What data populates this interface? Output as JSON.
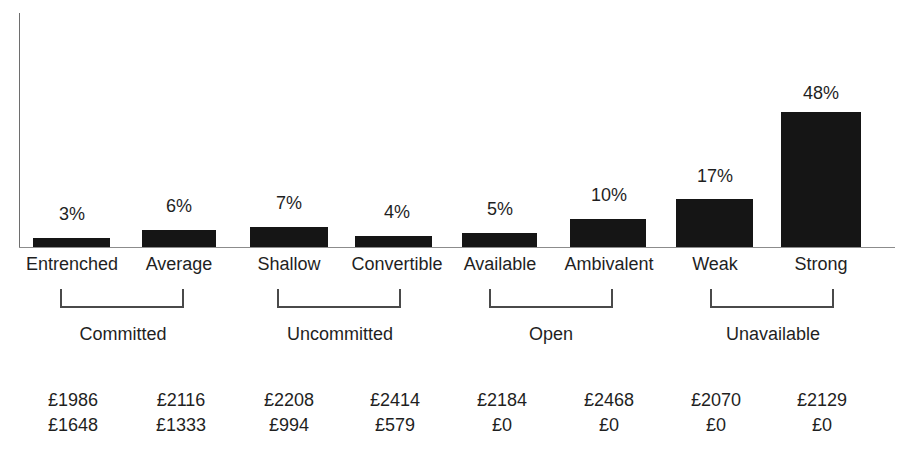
{
  "chart_data": {
    "type": "bar",
    "title": "",
    "subtitle": "",
    "xlabel": "",
    "ylabel": "",
    "ylim": [
      0,
      48
    ],
    "grid": false,
    "legend": "none",
    "axis": {
      "x_axis_visible": true,
      "y_axis_visible": true,
      "y_ticks": []
    },
    "categories": [
      "Entrenched",
      "Average",
      "Shallow",
      "Convertible",
      "Available",
      "Ambivalent",
      "Weak",
      "Strong"
    ],
    "values": [
      3,
      6,
      7,
      4,
      5,
      10,
      17,
      48
    ],
    "value_labels": [
      "3%",
      "6%",
      "7%",
      "4%",
      "5%",
      "10%",
      "17%",
      "48%"
    ],
    "groups": [
      {
        "label": "Committed",
        "categories": [
          "Entrenched",
          "Average"
        ]
      },
      {
        "label": "Uncommitted",
        "categories": [
          "Shallow",
          "Convertible"
        ]
      },
      {
        "label": "Open",
        "categories": [
          "Available",
          "Ambivalent"
        ]
      },
      {
        "label": "Unavailable",
        "categories": [
          "Weak",
          "Strong"
        ]
      }
    ],
    "annotations": {
      "row1": [
        "£1986",
        "£2116",
        "£2208",
        "£2414",
        "£2184",
        "£2468",
        "£2070",
        "£2129"
      ],
      "row2": [
        "£1648",
        "£1333",
        "£994",
        "£579",
        "£0",
        "£0",
        "£0",
        "£0"
      ]
    },
    "colors": {
      "bar": "#151515",
      "axis": "#8c8c8c",
      "text": "#1f1f1f",
      "bracket": "#4a4a4a",
      "background": "#ffffff"
    }
  },
  "bars": [
    {
      "label": "Entrenched",
      "value_label": "3%",
      "left": 33,
      "width": 77,
      "height": 9,
      "label_left": 10,
      "label_width": 124,
      "value_left": 10,
      "value_width": 124,
      "value_top": 205
    },
    {
      "label": "Average",
      "value_label": "6%",
      "left": 142,
      "width": 74,
      "height": 17,
      "label_left": 120,
      "label_width": 118,
      "value_left": 120,
      "value_width": 118,
      "value_top": 197
    },
    {
      "label": "Shallow",
      "value_label": "7%",
      "left": 250,
      "width": 78,
      "height": 20,
      "label_left": 231,
      "label_width": 116,
      "value_left": 231,
      "value_width": 116,
      "value_top": 194
    },
    {
      "label": "Convertible",
      "value_label": "4%",
      "left": 355,
      "width": 77,
      "height": 11,
      "label_left": 335,
      "label_width": 124,
      "value_left": 335,
      "value_width": 124,
      "value_top": 203
    },
    {
      "label": "Available",
      "value_label": "5%",
      "left": 462,
      "width": 75,
      "height": 14,
      "label_left": 443,
      "label_width": 114,
      "value_left": 443,
      "value_width": 114,
      "value_top": 200
    },
    {
      "label": "Ambivalent",
      "value_label": "10%",
      "left": 570,
      "width": 76,
      "height": 28,
      "label_left": 548,
      "label_width": 122,
      "value_left": 548,
      "value_width": 122,
      "value_top": 186
    },
    {
      "label": "Weak",
      "value_label": "17%",
      "left": 676,
      "width": 77,
      "height": 48,
      "label_left": 657,
      "label_width": 116,
      "value_left": 657,
      "value_width": 116,
      "value_top": 167
    },
    {
      "label": "Strong",
      "value_label": "48%",
      "left": 781,
      "width": 80,
      "height": 135,
      "label_left": 761,
      "label_width": 120,
      "value_left": 761,
      "value_width": 120,
      "value_top": 84
    }
  ],
  "groups": [
    {
      "label": "Committed",
      "bracket_left": 60,
      "bracket_width": 124,
      "label_left": 38,
      "label_width": 170
    },
    {
      "label": "Uncommitted",
      "bracket_left": 277,
      "bracket_width": 124,
      "label_left": 250,
      "label_width": 180
    },
    {
      "label": "Open",
      "bracket_left": 489,
      "bracket_width": 124,
      "label_left": 470,
      "label_width": 162
    },
    {
      "label": "Unavailable",
      "bracket_left": 710,
      "bracket_width": 124,
      "label_left": 685,
      "label_width": 176
    }
  ],
  "footer": [
    {
      "row1": "£1986",
      "row2": "£1648",
      "left": 18,
      "width": 110
    },
    {
      "row1": "£2116",
      "row2": "£1333",
      "left": 126,
      "width": 110
    },
    {
      "row1": "£2208",
      "row2": "£994",
      "left": 234,
      "width": 110
    },
    {
      "row1": "£2414",
      "row2": "£579",
      "left": 340,
      "width": 110
    },
    {
      "row1": "£2184",
      "row2": "£0",
      "left": 447,
      "width": 110
    },
    {
      "row1": "£2468",
      "row2": "£0",
      "left": 554,
      "width": 110
    },
    {
      "row1": "£2070",
      "row2": "£0",
      "left": 661,
      "width": 110
    },
    {
      "row1": "£2129",
      "row2": "£0",
      "left": 767,
      "width": 110
    }
  ]
}
